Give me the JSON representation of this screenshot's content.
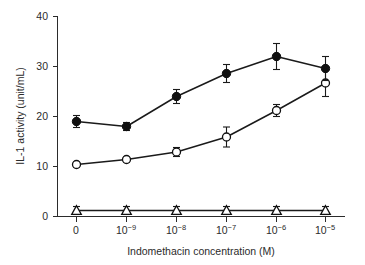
{
  "chart_data": {
    "type": "line",
    "title": "",
    "xlabel": "Indomethacin concentration (M)",
    "ylabel": "IL-1 activity (unit/mL)",
    "x_tick_labels": [
      "0",
      "10–9",
      "10–8",
      "10–7",
      "10–6",
      "10–5"
    ],
    "x_tick_bases": [
      "0",
      "10",
      "10",
      "10",
      "10",
      "10"
    ],
    "x_tick_exponents": [
      "",
      "−9",
      "−8",
      "−7",
      "−6",
      "−5"
    ],
    "x_categories": [
      "0",
      "1e-9",
      "1e-8",
      "1e-7",
      "1e-6",
      "1e-5"
    ],
    "y_tick_labels": [
      "0",
      "10",
      "20",
      "30",
      "40"
    ],
    "y_ticks": [
      0,
      10,
      20,
      30,
      40
    ],
    "ylim": [
      0,
      40
    ],
    "grid": false,
    "legend_position": "none",
    "series": [
      {
        "name": "filled-circle-series",
        "marker": "filled-circle",
        "values": [
          19.0,
          18.0,
          24.0,
          28.6,
          32.0,
          29.6
        ],
        "errors": [
          1.2,
          0.8,
          1.4,
          1.8,
          2.6,
          2.4
        ]
      },
      {
        "name": "open-circle-series",
        "marker": "open-circle",
        "values": [
          10.4,
          11.4,
          12.9,
          15.9,
          21.2,
          26.7
        ],
        "errors": [
          0.5,
          0.5,
          0.9,
          2.0,
          1.2,
          2.7
        ]
      },
      {
        "name": "open-triangle-series",
        "marker": "open-triangle",
        "values": [
          1.2,
          1.2,
          1.2,
          1.2,
          1.2,
          1.2
        ],
        "errors": [
          0.8,
          0.8,
          0.8,
          0.8,
          0.8,
          0.8
        ]
      }
    ],
    "colors": {
      "axis": "#2b2b2b",
      "line": "#1a1a1a",
      "filled_marker": "#101010",
      "open_marker_fill": "#ffffff",
      "background": "#ffffff"
    }
  }
}
